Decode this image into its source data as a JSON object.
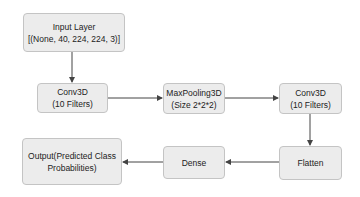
{
  "diagram": {
    "type": "flowchart",
    "nodes": [
      {
        "id": "input",
        "lines": [
          "Input Layer",
          "[(None, 40, 224, 224, 3)]"
        ]
      },
      {
        "id": "conv1",
        "lines": [
          "Conv3D",
          "(10 Filters)"
        ]
      },
      {
        "id": "pool",
        "lines": [
          "MaxPooling3D",
          "(Size 2*2*2)"
        ]
      },
      {
        "id": "conv2",
        "lines": [
          "Conv3D",
          "(10 Filters)"
        ]
      },
      {
        "id": "flatten",
        "lines": [
          "Flatten"
        ]
      },
      {
        "id": "dense",
        "lines": [
          "Dense"
        ]
      },
      {
        "id": "output",
        "lines": [
          "Output(Predicted Class",
          "Probabilities)"
        ]
      }
    ],
    "edges": [
      {
        "from": "input",
        "to": "conv1"
      },
      {
        "from": "conv1",
        "to": "pool"
      },
      {
        "from": "pool",
        "to": "conv2"
      },
      {
        "from": "conv2",
        "to": "flatten"
      },
      {
        "from": "flatten",
        "to": "dense"
      },
      {
        "from": "dense",
        "to": "output"
      }
    ],
    "colors": {
      "node_fill": "#ececec",
      "node_border": "#c4c4c4",
      "edge": "#444444",
      "text": "#222222"
    }
  }
}
